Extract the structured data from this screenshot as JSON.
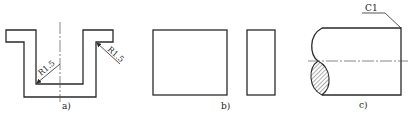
{
  "figures": {
    "a": {
      "label": "a)",
      "dimension_left": "R1.5",
      "dimension_right": "R1.5"
    },
    "b": {
      "label": "b)"
    },
    "c": {
      "label": "c)",
      "chamfer_callout": "C1"
    }
  },
  "colors": {
    "line": "#2a2a2a",
    "background": "#ffffff"
  }
}
